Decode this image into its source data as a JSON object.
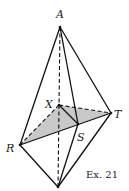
{
  "figure": {
    "caption": "Ex. 21",
    "fill_color": "#c8c8c8",
    "line_color": "#111111",
    "points": {
      "A": {
        "label": "A",
        "x": 60,
        "y": 27
      },
      "X": {
        "label": "X",
        "x": 59,
        "y": 105
      },
      "T": {
        "label": "T",
        "x": 111,
        "y": 113
      },
      "S": {
        "label": "S",
        "x": 78,
        "y": 124
      },
      "R": {
        "label": "R",
        "x": 20,
        "y": 145
      },
      "B": {
        "label": "",
        "x": 58,
        "y": 187
      }
    },
    "solid_edges": [
      "A-R",
      "A-T",
      "A-S",
      "R-S",
      "S-T",
      "R-B",
      "T-B",
      "S-B",
      "X-S"
    ],
    "dashed_edges": [
      "A-B",
      "X-R",
      "X-T"
    ],
    "shaded_region": [
      "X",
      "R",
      "T"
    ]
  }
}
